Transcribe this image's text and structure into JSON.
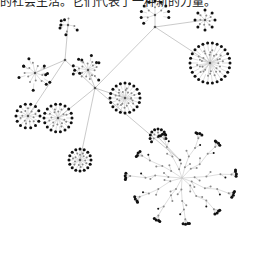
{
  "caption": "的社会生活。它们代表了一种新的力量。",
  "colors": {
    "background": "#ffffff",
    "edge": "#c8c8c8",
    "leaf_node": "#111111",
    "inner_node": "#8a8a8a",
    "hub_node": "#555555"
  },
  "graph": {
    "type": "network-tree",
    "hubs": [
      {
        "id": "h0",
        "x": 95,
        "y": 88
      },
      {
        "id": "h1",
        "x": 155,
        "y": 27
      },
      {
        "id": "h2",
        "x": 180,
        "y": 160
      },
      {
        "id": "h3",
        "x": 65,
        "y": 60
      }
    ],
    "hub_edges": [
      [
        "h0",
        "h1"
      ],
      [
        "h0",
        "h2"
      ],
      [
        "h0",
        "h3"
      ]
    ],
    "clusters": [
      {
        "name": "top-left-branch",
        "cx": 68,
        "cy": 25,
        "r": 10,
        "rings": 1,
        "leaves": 6,
        "inner": 4,
        "parent": "h3",
        "style": "scatter"
      },
      {
        "name": "top-middle-arc",
        "cx": 155,
        "cy": 15,
        "r": 14,
        "rings": 1,
        "leaves": 10,
        "inner": 4,
        "parent": "h1",
        "style": "arc"
      },
      {
        "name": "top-right-cluster",
        "cx": 205,
        "cy": 20,
        "r": 10,
        "rings": 2,
        "leaves": 8,
        "inner": 8,
        "parent": "h1",
        "style": "burst"
      },
      {
        "name": "right-big-burst",
        "cx": 210,
        "cy": 63,
        "r": 20,
        "rings": 3,
        "leaves": 26,
        "inner": 30,
        "parent": "h1",
        "style": "burst"
      },
      {
        "name": "center-burst",
        "cx": 125,
        "cy": 98,
        "r": 15,
        "rings": 3,
        "leaves": 20,
        "inner": 22,
        "parent": "h0",
        "style": "burst"
      },
      {
        "name": "left-fan",
        "cx": 35,
        "cy": 73,
        "r": 16,
        "rings": 2,
        "leaves": 10,
        "inner": 10,
        "parent": "h3",
        "style": "scatter"
      },
      {
        "name": "left-burst",
        "cx": 28,
        "cy": 116,
        "r": 12,
        "rings": 2,
        "leaves": 14,
        "inner": 12,
        "parent": "h3",
        "style": "burst"
      },
      {
        "name": "mid-left-burst",
        "cx": 58,
        "cy": 118,
        "r": 14,
        "rings": 2,
        "leaves": 18,
        "inner": 16,
        "parent": "h0",
        "style": "burst"
      },
      {
        "name": "lower-left-burst",
        "cx": 80,
        "cy": 160,
        "r": 11,
        "rings": 2,
        "leaves": 16,
        "inner": 14,
        "parent": "h0",
        "style": "burst"
      },
      {
        "name": "small-spiral",
        "cx": 158,
        "cy": 137,
        "r": 8,
        "rings": 1,
        "leaves": 10,
        "inner": 4,
        "parent": "h2",
        "style": "arc"
      },
      {
        "name": "upper-left-mixed",
        "cx": 88,
        "cy": 70,
        "r": 14,
        "rings": 2,
        "leaves": 10,
        "inner": 14,
        "parent": "h0",
        "style": "scatter"
      }
    ],
    "tree": {
      "name": "bottom-right-tree",
      "root": {
        "x": 182,
        "y": 178
      },
      "branches": 11,
      "depth": 4,
      "length": 50,
      "leaf_clusters": 3
    }
  }
}
